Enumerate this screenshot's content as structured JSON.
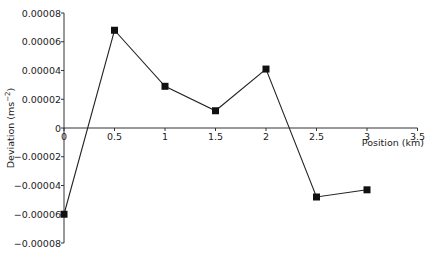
{
  "chart_data": {
    "type": "line",
    "title": "",
    "xlabel": "Position (km)",
    "ylabel": "Deviation (ms⁻²)",
    "xlim": [
      0,
      3.5
    ],
    "ylim": [
      -8e-05,
      8e-05
    ],
    "x_ticks": [
      0,
      0.5,
      1,
      1.5,
      2,
      2.5,
      3,
      3.5
    ],
    "x_tick_labels": [
      "0",
      "0.5",
      "1",
      "1.5",
      "2",
      "2.5",
      "3",
      "3.5"
    ],
    "y_ticks": [
      8e-05,
      6e-05,
      4e-05,
      2e-05,
      0,
      -2e-05,
      -4e-05,
      -6e-05,
      -8e-05
    ],
    "y_tick_labels": [
      "0.00008",
      "0.00006",
      "0.00004",
      "0.00002",
      "0",
      "−0.00002",
      "−0.00004",
      "−0.00006",
      "−0.00008"
    ],
    "grid": false,
    "legend": "none",
    "series": [
      {
        "name": "Deviation",
        "marker": "square",
        "color": "#111111",
        "x": [
          0,
          0.5,
          1,
          1.5,
          2,
          2.5,
          3
        ],
        "y": [
          -6e-05,
          6.8e-05,
          2.9e-05,
          1.2e-05,
          4.1e-05,
          -4.8e-05,
          -4.3e-05
        ]
      }
    ]
  }
}
